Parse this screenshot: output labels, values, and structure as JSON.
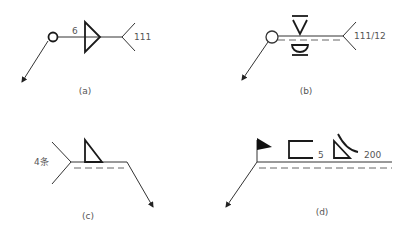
{
  "figures": {
    "a": {
      "caption": "(a)",
      "size_label": "6",
      "process_label": "111",
      "symbols": [
        "all-round-circle",
        "fillet-weld-triangle",
        "tail-fork"
      ]
    },
    "b": {
      "caption": "(b)",
      "process_label": "111/12",
      "symbols": [
        "all-round-circle",
        "v-weld-flush",
        "convex-backing",
        "identification-dashed-line",
        "tail-fork"
      ]
    },
    "c": {
      "caption": "(c)",
      "count_label": "4条",
      "symbols": [
        "fillet-weld-triangle",
        "identification-dashed-line",
        "tail-fork"
      ]
    },
    "d": {
      "caption": "(d)",
      "size_label": "5",
      "length_label": "200",
      "symbols": [
        "field-weld-flag",
        "square-groove",
        "fillet-weld-concave",
        "identification-dashed-line"
      ]
    }
  },
  "colors": {
    "line": "#333333",
    "bold": "#1a1a1a",
    "text": "#555555",
    "background": "#ffffff"
  }
}
